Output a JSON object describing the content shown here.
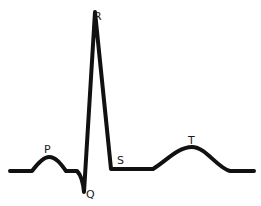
{
  "diagram": {
    "title": "",
    "stroke_color": "#111111",
    "labels": [
      {
        "id": "P",
        "text": "P",
        "x": 44,
        "y": 153
      },
      {
        "id": "Q",
        "text": "Q",
        "x": 86,
        "y": 197
      },
      {
        "id": "R",
        "text": "R",
        "x": 94,
        "y": 20
      },
      {
        "id": "S",
        "text": "S",
        "x": 117,
        "y": 164
      },
      {
        "id": "T",
        "text": "T",
        "x": 188,
        "y": 144
      }
    ]
  }
}
